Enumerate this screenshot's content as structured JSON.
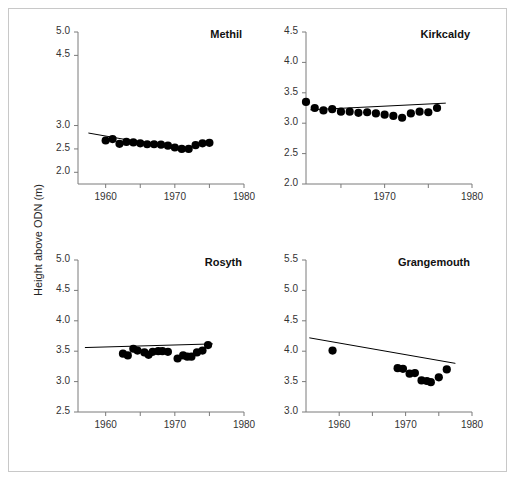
{
  "figure": {
    "ylabel": "Height above ODN (m)",
    "border_color": "#c8c8c8",
    "background": "#ffffff",
    "marker_color": "#000000",
    "line_color": "#000000"
  },
  "chart_data": [
    {
      "type": "scatter",
      "title": "Methil",
      "xlabel": "",
      "ylabel": "Height above ODN (m)",
      "xlim": [
        1956,
        1980
      ],
      "ylim": [
        1.75,
        5.0
      ],
      "xticks": [
        1960,
        1965,
        1970,
        1975,
        1980
      ],
      "xticklabels": [
        "1960",
        "",
        "1970",
        "",
        "1980"
      ],
      "yticks": [
        2.0,
        2.5,
        3.0,
        4.5,
        5.0
      ],
      "yticklabels": [
        "2.0",
        "2.5",
        "3.0",
        "4.5",
        "5.0"
      ],
      "grid": false,
      "x": [
        1960,
        1961,
        1962,
        1963,
        1964,
        1965,
        1966,
        1967,
        1968,
        1969,
        1970,
        1971,
        1972,
        1973,
        1974,
        1975
      ],
      "y": [
        2.68,
        2.71,
        2.61,
        2.65,
        2.64,
        2.62,
        2.6,
        2.6,
        2.59,
        2.57,
        2.53,
        2.5,
        2.5,
        2.58,
        2.62,
        2.63
      ],
      "trendline": {
        "x": [
          1957.5,
          1966.0
        ],
        "y": [
          2.84,
          2.62
        ]
      }
    },
    {
      "type": "scatter",
      "title": "Kirkcaldy",
      "xlabel": "",
      "ylabel": "Height above ODN (m)",
      "xlim": [
        1961,
        1980
      ],
      "ylim": [
        2.0,
        4.5
      ],
      "xticks": [
        1960,
        1965,
        1970,
        1975,
        1980
      ],
      "xticklabels": [
        "1960",
        "",
        "1970",
        "",
        "1980"
      ],
      "yticks": [
        2.0,
        2.5,
        3.0,
        3.5,
        4.0,
        4.5
      ],
      "yticklabels": [
        "2.0",
        "2.5",
        "3.0",
        "3.5",
        "4.0",
        "4.5"
      ],
      "grid": false,
      "x": [
        1961,
        1962,
        1963,
        1964,
        1965,
        1966,
        1967,
        1968,
        1969,
        1970,
        1971,
        1972,
        1973,
        1974,
        1975,
        1976
      ],
      "y": [
        3.35,
        3.25,
        3.21,
        3.23,
        3.19,
        3.19,
        3.17,
        3.18,
        3.16,
        3.14,
        3.12,
        3.09,
        3.16,
        3.19,
        3.18,
        3.25
      ],
      "trendline": {
        "x": [
          1961.5,
          1977.0
        ],
        "y": [
          3.22,
          3.33
        ]
      }
    },
    {
      "type": "scatter",
      "title": "Rosyth",
      "xlabel": "",
      "ylabel": "Height above ODN (m)",
      "xlim": [
        1956,
        1980
      ],
      "ylim": [
        2.5,
        5.0
      ],
      "xticks": [
        1960,
        1965,
        1970,
        1975,
        1980
      ],
      "xticklabels": [
        "1960",
        "",
        "1970",
        "",
        "1980"
      ],
      "yticks": [
        2.5,
        3.0,
        3.5,
        4.0,
        4.5,
        5.0
      ],
      "yticklabels": [
        "2.5",
        "3.0",
        "3.5",
        "4.0",
        "4.5",
        "5.0"
      ],
      "grid": false,
      "x": [
        1962.5,
        1963.2,
        1964.0,
        1964.6,
        1965.6,
        1966.2,
        1966.8,
        1967.6,
        1968.2,
        1969.0,
        1970.4,
        1971.2,
        1971.8,
        1972.4,
        1973.2,
        1974.0,
        1974.8
      ],
      "y": [
        3.46,
        3.43,
        3.54,
        3.51,
        3.48,
        3.44,
        3.49,
        3.5,
        3.5,
        3.49,
        3.38,
        3.43,
        3.41,
        3.41,
        3.48,
        3.51,
        3.6
      ],
      "trendline": {
        "x": [
          1957.0,
          1975.5
        ],
        "y": [
          3.56,
          3.62
        ]
      }
    },
    {
      "type": "scatter",
      "title": "Grangemouth",
      "xlabel": "",
      "ylabel": "Height above ODN (m)",
      "xlim": [
        1955,
        1980
      ],
      "ylim": [
        3.0,
        5.5
      ],
      "xticks": [
        1960,
        1965,
        1970,
        1975,
        1980
      ],
      "xticklabels": [
        "1960",
        "",
        "1970",
        "",
        "1980"
      ],
      "yticks": [
        3.0,
        3.5,
        4.0,
        4.5,
        5.0,
        5.5
      ],
      "yticklabels": [
        "3.0",
        "3.5",
        "4.0",
        "4.5",
        "5.0",
        "5.5"
      ],
      "grid": false,
      "x": [
        1959.0,
        1968.8,
        1969.6,
        1970.6,
        1971.4,
        1972.4,
        1973.2,
        1973.8,
        1975.0,
        1976.2
      ],
      "y": [
        4.01,
        3.72,
        3.71,
        3.63,
        3.64,
        3.52,
        3.51,
        3.49,
        3.57,
        3.7
      ],
      "trendline": {
        "x": [
          1955.5,
          1977.5
        ],
        "y": [
          4.22,
          3.8
        ]
      }
    }
  ]
}
